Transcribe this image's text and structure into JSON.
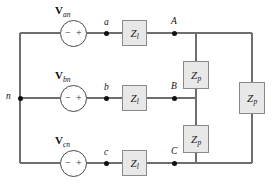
{
  "diagram": {
    "colors": {
      "wire": "#6e6e6e",
      "box_fill": "#e8e8e8",
      "box_border": "#8a8a8a",
      "node_dot": "#111111",
      "background": "#ffffff"
    }
  },
  "sources": [
    {
      "id": "van",
      "label_v": "V",
      "label_sub": "an",
      "plus": "+",
      "minus": "−"
    },
    {
      "id": "vbn",
      "label_v": "V",
      "label_sub": "bn",
      "plus": "+",
      "minus": "−"
    },
    {
      "id": "vcn",
      "label_v": "V",
      "label_sub": "cn",
      "plus": "+",
      "minus": "−"
    }
  ],
  "nodes": {
    "neutral": "n",
    "source_a": "a",
    "source_b": "b",
    "source_c": "c",
    "load_a": "A",
    "load_b": "B",
    "load_c": "C"
  },
  "line_impedances": [
    {
      "id": "zl-a",
      "label": "Z",
      "sub": "l"
    },
    {
      "id": "zl-b",
      "label": "Z",
      "sub": "l"
    },
    {
      "id": "zl-c",
      "label": "Z",
      "sub": "l"
    }
  ],
  "phase_impedances": [
    {
      "id": "zp-ab",
      "label": "Z",
      "sub": "p"
    },
    {
      "id": "zp-bc",
      "label": "Z",
      "sub": "p"
    },
    {
      "id": "zp-ca",
      "label": "Z",
      "sub": "p"
    }
  ]
}
